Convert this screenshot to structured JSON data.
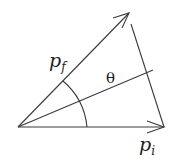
{
  "diagram": {
    "type": "vector-angle",
    "vectors": [
      {
        "name": "p_f",
        "label": "p",
        "subscript": "f"
      },
      {
        "name": "p_i",
        "label": "p",
        "subscript": "i"
      }
    ],
    "angle": {
      "label": "θ"
    },
    "colors": {
      "stroke": "#3a3a3a",
      "text": "#222222",
      "background": "#ffffff"
    }
  }
}
